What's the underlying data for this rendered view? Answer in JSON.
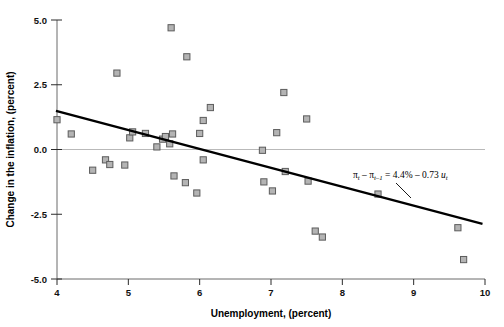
{
  "figure": {
    "background": "#ffffff",
    "marker_fill": "#b4b4b4",
    "marker_stroke": "#5c5c5c",
    "line_color": "#000000",
    "axis_color": "#6b6b6b"
  },
  "axes": {
    "x_title": "Unemployment, (percent)",
    "y_title": "Change in the inflation, (percent)",
    "x_ticks": [
      "4",
      "5",
      "6",
      "7",
      "8",
      "9",
      "10"
    ],
    "y_ticks": [
      "5.0",
      "2.5",
      "0.0",
      "-2.5",
      "-5.0"
    ]
  },
  "annotation": {
    "pi": "π",
    "t": "t",
    "t_minus_1": "t–1",
    "minus": "–",
    "equals": "=",
    "intercept": "4.4%",
    "slope": "0.73",
    "u": "u",
    "full_text": "πt – πt–1 = 4.4% – 0.73 ut"
  },
  "chart_data": {
    "type": "scatter",
    "title": "",
    "xlabel": "Unemployment, (percent)",
    "ylabel": "Change in the inflation, (percent)",
    "xlim": [
      4,
      10
    ],
    "ylim": [
      -5.0,
      5.0
    ],
    "xticks": [
      4,
      5,
      6,
      7,
      8,
      9,
      10
    ],
    "yticks": [
      -5.0,
      -2.5,
      0.0,
      2.5,
      5.0
    ],
    "grid": false,
    "zero_reference_line": 0.0,
    "legend": "none",
    "series": [
      {
        "name": "Change in inflation vs unemployment",
        "marker": "square",
        "points": [
          [
            4.0,
            1.15
          ],
          [
            4.2,
            0.6
          ],
          [
            4.5,
            -0.8
          ],
          [
            4.68,
            -0.4
          ],
          [
            4.74,
            -0.58
          ],
          [
            4.84,
            2.95
          ],
          [
            4.95,
            -0.6
          ],
          [
            5.02,
            0.45
          ],
          [
            5.06,
            0.68
          ],
          [
            5.24,
            0.62
          ],
          [
            5.4,
            0.1
          ],
          [
            5.48,
            0.4
          ],
          [
            5.52,
            0.5
          ],
          [
            5.58,
            0.22
          ],
          [
            5.6,
            4.7
          ],
          [
            5.62,
            0.6
          ],
          [
            5.64,
            -1.02
          ],
          [
            5.8,
            -1.28
          ],
          [
            5.82,
            3.58
          ],
          [
            5.96,
            -1.68
          ],
          [
            6.0,
            0.62
          ],
          [
            6.05,
            -0.4
          ],
          [
            6.05,
            1.12
          ],
          [
            6.15,
            1.62
          ],
          [
            6.88,
            -0.03
          ],
          [
            6.9,
            -1.25
          ],
          [
            7.02,
            -1.6
          ],
          [
            7.08,
            0.65
          ],
          [
            7.18,
            2.2
          ],
          [
            7.2,
            -0.85
          ],
          [
            7.5,
            1.18
          ],
          [
            7.52,
            -1.22
          ],
          [
            7.62,
            -3.15
          ],
          [
            7.72,
            -3.38
          ],
          [
            8.5,
            -1.72
          ],
          [
            9.62,
            -3.02
          ],
          [
            9.7,
            -4.25
          ]
        ]
      }
    ],
    "fit_line": {
      "label": "πt – πt–1 = 4.4% – 0.73 ut",
      "intercept": 4.4,
      "slope": -0.73,
      "x_start": 4.0,
      "x_end": 9.95,
      "y_start": 1.48,
      "y_end": -2.86
    }
  }
}
